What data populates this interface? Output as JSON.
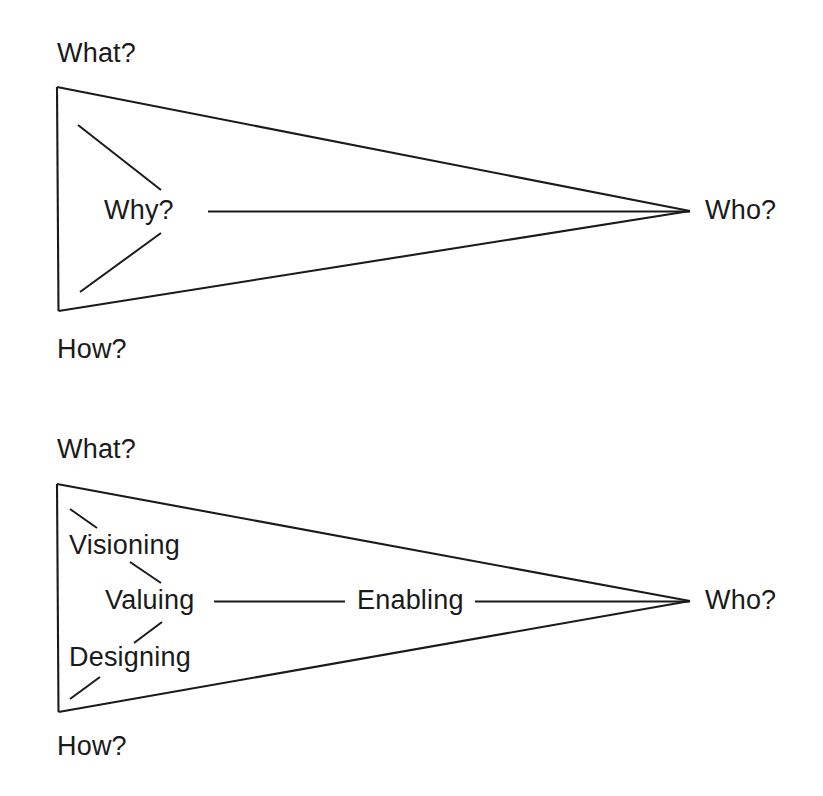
{
  "page": {
    "background_color": "#ffffff",
    "line_color": "#1a1a1a",
    "width": 823,
    "height": 796
  },
  "diagram_top": {
    "name": "question-triangle",
    "corner_top_label": "What?",
    "corner_bottom_label": "How?",
    "center_label": "Why?",
    "apex_label": "Who?"
  },
  "diagram_bottom": {
    "name": "practice-triangle",
    "corner_top_label": "What?",
    "corner_bottom_label": "How?",
    "node_top_label": "Visioning",
    "node_center_label": "Valuing",
    "node_bottom_label": "Designing",
    "edge_label": "Enabling",
    "apex_label": "Who?"
  }
}
